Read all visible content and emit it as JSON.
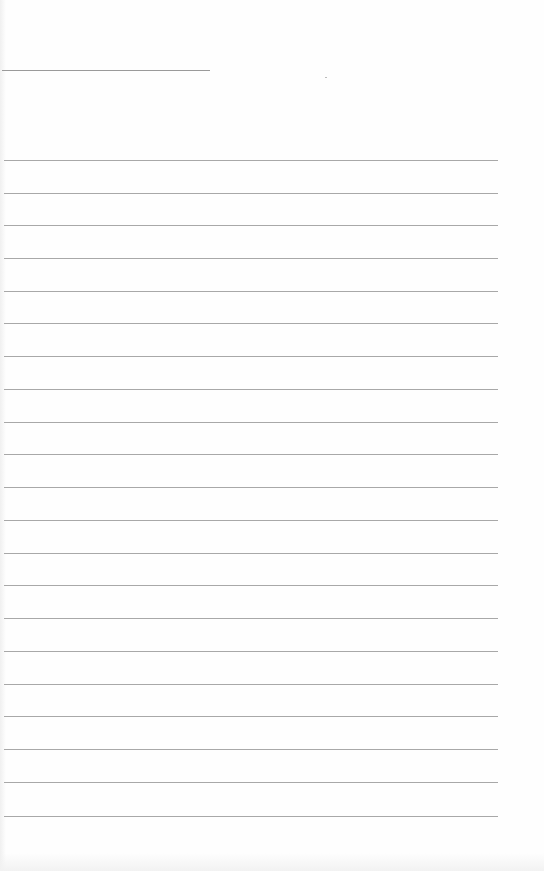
{
  "document": {
    "type": "blank lined notebook page",
    "text_content": "",
    "header_line": {
      "x": 2,
      "y": 70,
      "width": 208
    },
    "ruled_lines": {
      "count": 21,
      "x": 4,
      "width": 494,
      "y_positions": [
        160,
        193,
        225,
        258,
        291,
        323,
        356,
        389,
        422,
        454,
        487,
        520,
        553,
        585,
        618,
        651,
        684,
        716,
        749,
        782,
        816
      ]
    },
    "colors": {
      "paper": "#fefefe",
      "line": "#a8a8a8",
      "header_line": "#9a9a9a"
    }
  }
}
